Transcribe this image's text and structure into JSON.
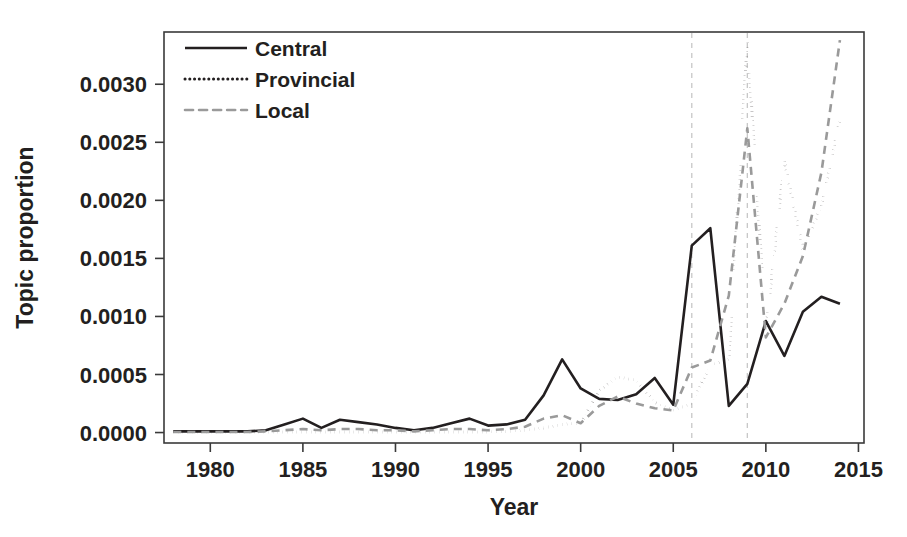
{
  "chart_data": {
    "type": "line",
    "title": "",
    "xlabel": "Year",
    "ylabel": "Topic proportion",
    "xlim": [
      1977.5,
      2015.3
    ],
    "ylim": [
      -9e-05,
      0.00345
    ],
    "grid": false,
    "legend_position": "top-left inside",
    "xticks": [
      1980,
      1985,
      1990,
      1995,
      2000,
      2005,
      2010,
      2015
    ],
    "xtick_labels": [
      "1980",
      "1985",
      "1990",
      "1995",
      "2000",
      "2005",
      "2010",
      "2015"
    ],
    "yticks": [
      0.0,
      0.0005,
      0.001,
      0.0015,
      0.002,
      0.0025,
      0.003
    ],
    "ytick_labels": [
      "0.0000",
      "0.0005",
      "0.0010",
      "0.0015",
      "0.0020",
      "0.0025",
      "0.0030"
    ],
    "annotations": [
      {
        "type": "vline",
        "x": 2006,
        "style": "dashed",
        "color": "#c8c8c8"
      },
      {
        "type": "vline",
        "x": 2009,
        "style": "dashed",
        "color": "#c8c8c8"
      }
    ],
    "x": [
      1978,
      1979,
      1980,
      1981,
      1982,
      1983,
      1984,
      1985,
      1986,
      1987,
      1988,
      1989,
      1990,
      1991,
      1992,
      1993,
      1994,
      1995,
      1996,
      1997,
      1998,
      1999,
      2000,
      2001,
      2002,
      2003,
      2004,
      2005,
      2006,
      2007,
      2008,
      2009,
      2010,
      2011,
      2012,
      2013,
      2014
    ],
    "series": [
      {
        "name": "Central",
        "color": "#231f20",
        "dash": "solid",
        "width": 2.6,
        "values": [
          1e-05,
          1e-05,
          1e-05,
          1e-05,
          1e-05,
          2e-05,
          7e-05,
          0.00012,
          4e-05,
          0.00011,
          9e-05,
          7e-05,
          4e-05,
          2e-05,
          4e-05,
          8e-05,
          0.00012,
          6e-05,
          7e-05,
          0.00011,
          0.00032,
          0.00063,
          0.00038,
          0.00029,
          0.00028,
          0.00033,
          0.00047,
          0.00024,
          0.00161,
          0.00176,
          0.00023,
          0.00042,
          0.00096,
          0.00066,
          0.00104,
          0.00117,
          0.00111
        ]
      },
      {
        "name": "Provincial",
        "color": "#231f20",
        "dash": "dotted",
        "width": 3.0,
        "values": [
          5e-06,
          5e-06,
          5e-06,
          5e-06,
          5e-06,
          5e-06,
          5e-06,
          5e-06,
          5e-06,
          5e-06,
          5e-06,
          5e-06,
          5e-06,
          5e-06,
          5e-06,
          5e-06,
          5e-06,
          5e-06,
          1e-05,
          2e-05,
          4e-05,
          7e-05,
          8e-05,
          0.00036,
          0.00048,
          0.00045,
          0.00026,
          0.00019,
          0.00025,
          0.00058,
          0.00063,
          0.00339,
          0.00088,
          0.00234,
          0.00158,
          0.00195,
          0.0027
        ]
      },
      {
        "name": "Local",
        "color": "#9a9a9a",
        "dash": "dashed",
        "width": 2.6,
        "values": [
          5e-06,
          5e-06,
          5e-06,
          5e-06,
          5e-06,
          1e-05,
          2e-05,
          3e-05,
          2e-05,
          3e-05,
          3e-05,
          2e-05,
          2e-05,
          1e-05,
          2e-05,
          3e-05,
          3e-05,
          2e-05,
          3e-05,
          5e-05,
          0.00012,
          0.00015,
          8e-05,
          0.00023,
          0.00031,
          0.00025,
          0.00021,
          0.00019,
          0.00056,
          0.00062,
          0.00118,
          0.00262,
          0.00082,
          0.00111,
          0.00152,
          0.00224,
          0.00338
        ]
      }
    ]
  },
  "legend": {
    "items": [
      {
        "label": "Central",
        "dash": "solid",
        "color": "#231f20"
      },
      {
        "label": "Provincial",
        "dash": "dotted",
        "color": "#231f20"
      },
      {
        "label": "Local",
        "dash": "dashed",
        "color": "#9a9a9a"
      }
    ]
  }
}
